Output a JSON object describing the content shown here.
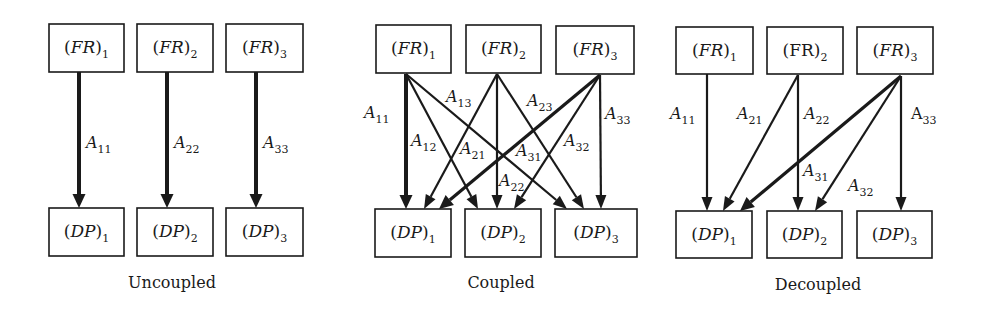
{
  "figure": {
    "width": 983,
    "height": 315,
    "colors": {
      "ink": "#1a1a1a",
      "background": "#ffffff"
    }
  },
  "panels": [
    {
      "id": "uncoupled",
      "caption": "Uncoupled",
      "caption_pos": [
        172,
        288
      ],
      "boxes": [
        {
          "id": "FR1",
          "base": "FR",
          "sub": "1",
          "italic": true,
          "x": 49,
          "y": 24,
          "w": 75,
          "h": 48
        },
        {
          "id": "FR2",
          "base": "FR",
          "sub": "2",
          "italic": true,
          "x": 137,
          "y": 24,
          "w": 76,
          "h": 48
        },
        {
          "id": "FR3",
          "base": "FR",
          "sub": "3",
          "italic": true,
          "x": 226,
          "y": 24,
          "w": 77,
          "h": 48
        },
        {
          "id": "DP1",
          "base": "DP",
          "sub": "1",
          "italic": true,
          "x": 49,
          "y": 208,
          "w": 75,
          "h": 48
        },
        {
          "id": "DP2",
          "base": "DP",
          "sub": "2",
          "italic": true,
          "x": 137,
          "y": 208,
          "w": 76,
          "h": 48
        },
        {
          "id": "DP3",
          "base": "DP",
          "sub": "3",
          "italic": true,
          "x": 226,
          "y": 208,
          "w": 77,
          "h": 48
        }
      ],
      "edges": [
        {
          "label": "A",
          "sub": "11",
          "italic": true,
          "from": [
            79,
            72
          ],
          "to": [
            79,
            208
          ],
          "width": 4,
          "label_pos": [
            86,
            148
          ]
        },
        {
          "label": "A",
          "sub": "22",
          "italic": true,
          "from": [
            167,
            72
          ],
          "to": [
            167,
            208
          ],
          "width": 4,
          "label_pos": [
            174,
            148
          ]
        },
        {
          "label": "A",
          "sub": "33",
          "italic": true,
          "from": [
            256,
            72
          ],
          "to": [
            256,
            208
          ],
          "width": 4,
          "label_pos": [
            263,
            148
          ]
        }
      ]
    },
    {
      "id": "coupled",
      "caption": "Coupled",
      "caption_pos": [
        501,
        288
      ],
      "boxes": [
        {
          "id": "FR1",
          "base": "FR",
          "sub": "1",
          "italic": true,
          "x": 376,
          "y": 25,
          "w": 75,
          "h": 48
        },
        {
          "id": "FR2",
          "base": "FR",
          "sub": "2",
          "italic": true,
          "x": 466,
          "y": 25,
          "w": 75,
          "h": 48
        },
        {
          "id": "FR3",
          "base": "FR",
          "sub": "3",
          "italic": true,
          "x": 556,
          "y": 26,
          "w": 78,
          "h": 48
        },
        {
          "id": "DP1",
          "base": "DP",
          "sub": "1",
          "italic": true,
          "x": 375,
          "y": 209,
          "w": 76,
          "h": 48
        },
        {
          "id": "DP2",
          "base": "DP",
          "sub": "2",
          "italic": true,
          "x": 465,
          "y": 209,
          "w": 76,
          "h": 48
        },
        {
          "id": "DP3",
          "base": "DP",
          "sub": "3",
          "italic": true,
          "x": 555,
          "y": 209,
          "w": 82,
          "h": 48
        }
      ],
      "edges": [
        {
          "label": "A",
          "sub": "11",
          "italic": true,
          "from": [
            406,
            74
          ],
          "to": [
            406,
            209
          ],
          "width": 4,
          "label_pos": [
            364,
            118
          ]
        },
        {
          "label": "A",
          "sub": "12",
          "italic": true,
          "from": [
            406,
            74
          ],
          "to": [
            478,
            209
          ],
          "width": 2.2,
          "label_pos": [
            411,
            146
          ]
        },
        {
          "label": "A",
          "sub": "13",
          "italic": true,
          "from": [
            406,
            74
          ],
          "to": [
            567,
            209
          ],
          "width": 2.2,
          "label_pos": [
            446,
            102
          ]
        },
        {
          "label": "A",
          "sub": "21",
          "italic": true,
          "from": [
            497,
            74
          ],
          "to": [
            424,
            209
          ],
          "width": 2.2,
          "label_pos": [
            460,
            154
          ]
        },
        {
          "label": "A",
          "sub": "22",
          "italic": true,
          "from": [
            497,
            74
          ],
          "to": [
            497,
            209
          ],
          "width": 2.2,
          "label_pos": [
            499,
            186
          ]
        },
        {
          "label": "A",
          "sub": "23",
          "italic": true,
          "from": [
            497,
            74
          ],
          "to": [
            584,
            209
          ],
          "width": 2.2,
          "label_pos": [
            527,
            106
          ]
        },
        {
          "label": "A",
          "sub": "31",
          "italic": true,
          "from": [
            600,
            75
          ],
          "to": [
            439,
            209
          ],
          "width": 3.2,
          "label_pos": [
            516,
            156
          ]
        },
        {
          "label": "A",
          "sub": "32",
          "italic": true,
          "from": [
            600,
            75
          ],
          "to": [
            514,
            209
          ],
          "width": 2.2,
          "label_pos": [
            564,
            146
          ]
        },
        {
          "label": "A",
          "sub": "33",
          "italic": true,
          "from": [
            600,
            75
          ],
          "to": [
            601,
            209
          ],
          "width": 2.2,
          "label_pos": [
            605,
            119
          ]
        }
      ]
    },
    {
      "id": "decoupled",
      "caption": "Decoupled",
      "caption_pos": [
        818,
        290
      ],
      "boxes": [
        {
          "id": "FR1",
          "base": "FR",
          "sub": "1",
          "italic": true,
          "x": 676,
          "y": 27,
          "w": 77,
          "h": 47
        },
        {
          "id": "FR2",
          "base": "FR",
          "sub": "2",
          "italic": false,
          "x": 767,
          "y": 27,
          "w": 76,
          "h": 47
        },
        {
          "id": "FR3",
          "base": "FR",
          "sub": "3",
          "italic": true,
          "x": 857,
          "y": 27,
          "w": 76,
          "h": 47
        },
        {
          "id": "DP1",
          "base": "DP",
          "sub": "1",
          "italic": true,
          "x": 676,
          "y": 211,
          "w": 76,
          "h": 47
        },
        {
          "id": "DP2",
          "base": "DP",
          "sub": "2",
          "italic": true,
          "x": 767,
          "y": 211,
          "w": 75,
          "h": 47
        },
        {
          "id": "DP3",
          "base": "DP",
          "sub": "3",
          "italic": true,
          "x": 857,
          "y": 211,
          "w": 75,
          "h": 47
        }
      ],
      "edges": [
        {
          "label": "A",
          "sub": "11",
          "italic": true,
          "from": [
            707,
            74
          ],
          "to": [
            707,
            211
          ],
          "width": 2.2,
          "label_pos": [
            670,
            119
          ]
        },
        {
          "label": "A",
          "sub": "21",
          "italic": true,
          "from": [
            798,
            75
          ],
          "to": [
            723,
            211
          ],
          "width": 2.2,
          "label_pos": [
            737,
            119
          ]
        },
        {
          "label": "A",
          "sub": "22",
          "italic": true,
          "from": [
            798,
            75
          ],
          "to": [
            798,
            211
          ],
          "width": 2.2,
          "label_pos": [
            804,
            119
          ]
        },
        {
          "label": "A",
          "sub": "31",
          "italic": true,
          "from": [
            901,
            76
          ],
          "to": [
            740,
            211
          ],
          "width": 3.2,
          "label_pos": [
            803,
            176
          ]
        },
        {
          "label": "A",
          "sub": "32",
          "italic": true,
          "from": [
            901,
            76
          ],
          "to": [
            815,
            211
          ],
          "width": 2.2,
          "label_pos": [
            848,
            191
          ]
        },
        {
          "label": "A",
          "sub": "33",
          "italic": false,
          "from": [
            901,
            76
          ],
          "to": [
            901,
            211
          ],
          "width": 2.2,
          "label_pos": [
            911,
            119
          ]
        }
      ]
    }
  ]
}
